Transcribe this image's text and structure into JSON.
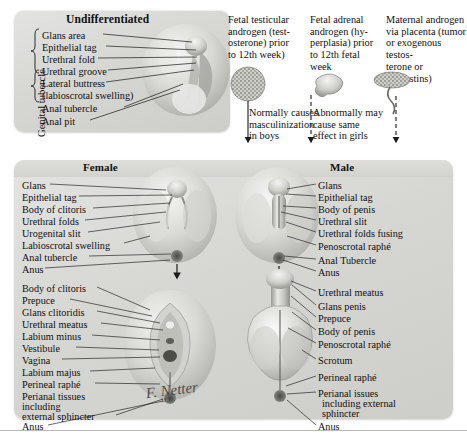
{
  "plate": {
    "signature": "F. Netter",
    "signature_suffix": "M.D."
  },
  "undifferentiated": {
    "title": "Undifferentiated",
    "side_label": "Genital tubercle",
    "labels": [
      "Glans area",
      "Epithelial tag",
      "Urethral fold",
      "Urethral groove",
      "Lateral buttress",
      "(labioscrotal swelling)",
      "Anal tubercle",
      "Anal pit"
    ]
  },
  "causes": {
    "columns": [
      "Fetal testicular androgen (testosterone) prior to 12th week)",
      "Fetal adrenal androgen (hyperplasia) prior to 12th fetal week",
      "Maternal androgen via placenta (tumor or exogenous testosterone or progestins)"
    ],
    "column_lines": [
      [
        "Fetal testicular",
        "androgen (test-",
        "osterone) prior",
        "to 12th week)"
      ],
      [
        "Fetal adrenal",
        "androgen (hy-",
        "perplasia) prior",
        "to 12th fetal",
        "week"
      ],
      [
        "Maternal androgen",
        "via placenta (tumor",
        "or exogenous testos-",
        "terone or progestins)"
      ]
    ],
    "effects": [
      [
        "Normally causes",
        "masculinization",
        "in boys"
      ],
      [
        "Abnormally may",
        "cause same",
        "effect in girls"
      ]
    ],
    "icons": [
      "testis-icon",
      "adrenal-gland-icon",
      "placenta-icon"
    ]
  },
  "main": {
    "female_title": "Female",
    "male_title": "Male",
    "female_upper_labels": [
      "Glans",
      "Epithelial tag",
      "Body of clitoris",
      "Urethral folds",
      "Urogenital slit",
      "Labioscrotal swelling",
      "Anal tubercle",
      "Anus"
    ],
    "female_lower_labels": [
      "Body of clitoris",
      "Prepuce",
      "Glans clitoridis",
      "Urethral meatus",
      "Labium minus",
      "Vestibule",
      "Vagina",
      "Labium majus",
      "Perineal raphé",
      "Perianal tissues",
      "including",
      "external sphincter",
      "Anus"
    ],
    "male_upper_labels": [
      "Glans",
      "Epithelial tag",
      "Body of penis",
      "Urethral slit",
      "Urethral folds fusing",
      "Penoscrotal raphé",
      "Anal Tubercle",
      "Anus"
    ],
    "male_lower_labels": [
      "Urethral meatus",
      "Glans penis",
      "Prepuce",
      "Body of penis",
      "Penoscrotal raphé",
      "Scrotum",
      "Perineal raphé",
      "Perianal issues",
      "including external",
      "sphincter",
      "Anus"
    ]
  },
  "colors": {
    "panel_light": "#e3e3e1",
    "panel_dark": "#cdcdc9",
    "ink": "#111111",
    "rule": "#b9b9b9"
  }
}
